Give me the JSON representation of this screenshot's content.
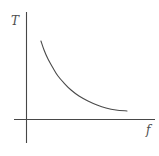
{
  "figure": {
    "background": "#ffffff",
    "axis_color": "#474747",
    "curve_color": "#4a4a4a",
    "label_color": "#4d4d4d"
  },
  "chart_data": {
    "type": "line",
    "title": "",
    "xlabel": "f",
    "ylabel": "T",
    "shape": "inverse-proportional decay (rectangular hyperbola, T ~ 1/f)",
    "grid": false,
    "legend": null,
    "xlim": [
      0,
      1
    ],
    "ylim": [
      0,
      1
    ],
    "x": [
      0.113,
      0.137,
      0.168,
      0.207,
      0.246,
      0.293,
      0.348,
      0.41,
      0.48,
      0.551,
      0.621,
      0.699,
      0.785
    ],
    "y": [
      0.762,
      0.675,
      0.587,
      0.5,
      0.422,
      0.354,
      0.286,
      0.228,
      0.18,
      0.141,
      0.112,
      0.092,
      0.083
    ]
  }
}
